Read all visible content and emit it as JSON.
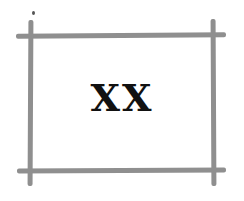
{
  "figure": {
    "label": "XX",
    "frame_color": "#8f8f8f",
    "text_color": "#111111",
    "background": "#ffffff"
  }
}
